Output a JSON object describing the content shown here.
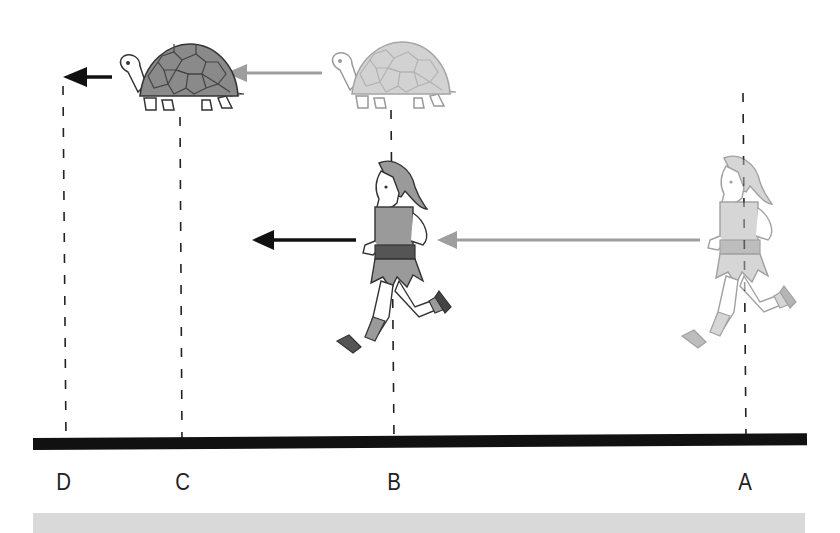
{
  "diagram": {
    "positions": [
      {
        "id": "D",
        "label": "D",
        "x": 63
      },
      {
        "id": "C",
        "label": "C",
        "x": 182
      },
      {
        "id": "B",
        "label": "B",
        "x": 395
      },
      {
        "id": "A",
        "label": "A",
        "x": 745
      }
    ],
    "figures": [
      {
        "name": "tortoise-current",
        "at": "C",
        "shade": "dark"
      },
      {
        "name": "tortoise-previous",
        "at": "B",
        "shade": "faded"
      },
      {
        "name": "runner-current",
        "at": "B",
        "shade": "dark"
      },
      {
        "name": "runner-previous",
        "at": "A",
        "shade": "faded"
      }
    ],
    "arrows": [
      {
        "name": "tortoise-arrow-to-D",
        "color": "#111111",
        "direction": "left"
      },
      {
        "name": "tortoise-arrow-B-to-C",
        "color": "#9e9e9e",
        "direction": "left"
      },
      {
        "name": "runner-arrow-ahead",
        "color": "#111111",
        "direction": "left"
      },
      {
        "name": "runner-arrow-A-to-B",
        "color": "#9e9e9e",
        "direction": "left"
      }
    ],
    "colors": {
      "ground": "#111111",
      "dark_fill": "#8a8a8a",
      "faded_fill": "#c4c4c4",
      "faded_arrow": "#9e9e9e",
      "band": "#d9d9d9"
    }
  }
}
